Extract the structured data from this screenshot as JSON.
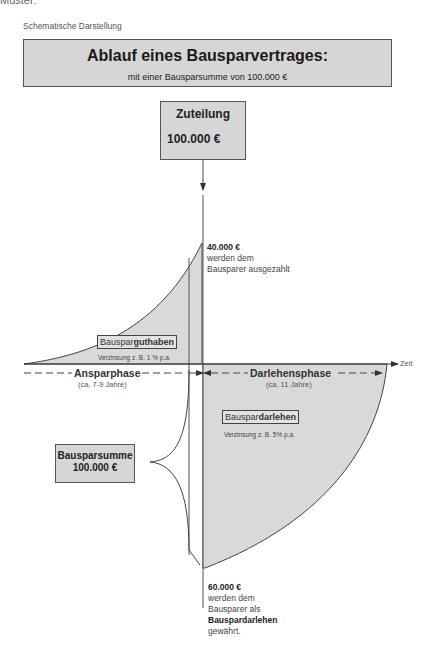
{
  "cropped_text": "Muster:",
  "subtitle": "Schematische Darstellung",
  "title": {
    "main": "Ablauf eines Bausparvertrages:",
    "sub": "mit einer Bausparsumme von 100.000 €"
  },
  "zuteilung": {
    "title": "Zuteilung",
    "value": "100.000 €"
  },
  "payout_note": {
    "amount": "40.000 €",
    "line1": "werden dem",
    "line2": "Bausparer ausgezahlt"
  },
  "guthaben": {
    "label_prefix": "Bauspar",
    "label_bold": "guthaben",
    "rate": "Verzinsung z. B. 1 % p.a."
  },
  "axis": {
    "time_label": "Zeit"
  },
  "phases": {
    "anspar": {
      "label": "Ansparphase",
      "duration": "(ca. 7-9 Jahre)"
    },
    "darlehen": {
      "label": "Darlehensphase",
      "duration": "(ca. 11 Jahre)"
    }
  },
  "darlehen": {
    "label_prefix": "Bauspar",
    "label_bold": "darlehen",
    "rate": "Verzinsung z. B. 5% p.a."
  },
  "bausparsumme": {
    "title": "Bausparsumme",
    "value": "100.000 €"
  },
  "loan_note": {
    "amount": "60.000 €",
    "line1": "werden dem",
    "line2": "Bausparer als",
    "line3": "Bauspardarlehen",
    "line4": "gewährt."
  },
  "colors": {
    "fill": "#d6d6d6",
    "stroke": "#444444",
    "background": "#ffffff"
  }
}
